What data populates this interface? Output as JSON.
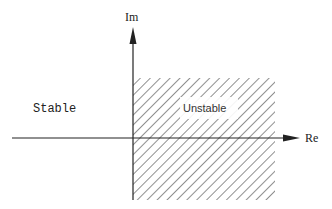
{
  "diagram": {
    "axes": {
      "imaginary_label": "Im",
      "real_label": "Re"
    },
    "regions": {
      "left_label": "Stable",
      "right_label": "Unstable"
    },
    "colors": {
      "ink": "#222222",
      "background": "#ffffff"
    }
  }
}
